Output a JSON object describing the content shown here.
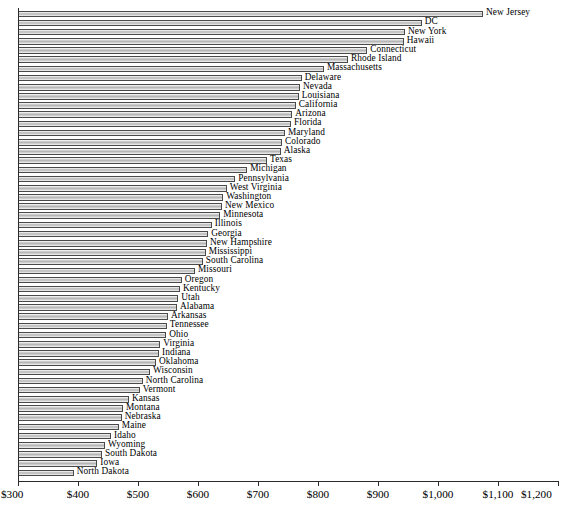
{
  "chart_data": {
    "type": "bar",
    "orientation": "horizontal",
    "title": "",
    "subtitle": "",
    "xlabel": "",
    "ylabel": "",
    "xlim": [
      300,
      1200
    ],
    "ylim": null,
    "grid": false,
    "legend": null,
    "axis": {
      "tick_values": [
        300,
        400,
        500,
        600,
        700,
        800,
        900,
        1000,
        1100,
        1200
      ],
      "tick_labels": [
        "$300",
        "$400",
        "$500",
        "$600",
        "$700",
        "$800",
        "$900",
        "$1,000",
        "$1,100",
        "$1,200"
      ]
    },
    "categories": [
      "New Jersey",
      "DC",
      "New York",
      "Hawaii",
      "Connecticut",
      "Rhode Island",
      "Massachusetts",
      "Delaware",
      "Nevada",
      "Louisiana",
      "California",
      "Arizona",
      "Florida",
      "Maryland",
      "Colorado",
      "Alaska",
      "Texas",
      "Michigan",
      "Pennsylvania",
      "West Virginia",
      "Washington",
      "New Mexico",
      "Minnesota",
      "Illinois",
      "Georgia",
      "New Hampshire",
      "Mississippi",
      "South Carolina",
      "Missouri",
      "Oregon",
      "Kentucky",
      "Utah",
      "Alabama",
      "Arkansas",
      "Tennessee",
      "Ohio",
      "Virginia",
      "Indiana",
      "Oklahoma",
      "Wisconsin",
      "North Carolina",
      "Vermont",
      "Kansas",
      "Montana",
      "Nebraska",
      "Maine",
      "Idaho",
      "Wyoming",
      "South Dakota",
      "Iowa",
      "North Dakota"
    ],
    "values": [
      1075,
      973,
      945,
      943,
      882,
      850,
      810,
      773,
      770,
      768,
      763,
      757,
      755,
      745,
      740,
      738,
      715,
      682,
      662,
      648,
      642,
      640,
      637,
      623,
      617,
      615,
      613,
      608,
      595,
      573,
      570,
      567,
      565,
      550,
      548,
      547,
      537,
      535,
      530,
      520,
      508,
      503,
      485,
      475,
      473,
      468,
      455,
      445,
      440,
      432,
      393
    ],
    "value_unit": "$"
  },
  "colors": {
    "bar_fill_light": "#f4f4f4",
    "bar_fill_mid": "#b4b4b4",
    "bar_border": "#4a4a4a",
    "axis": "#2b2b2b",
    "text": "#000000",
    "background": "#ffffff"
  }
}
